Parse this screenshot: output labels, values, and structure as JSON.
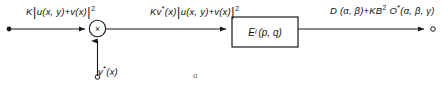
{
  "figure": {
    "caption": "a",
    "type": "signal-flow-block-diagram"
  },
  "labels": {
    "input_left": {
      "prefix": "K",
      "bar_open": "|",
      "body": "u(x, y)+v(x)",
      "bar_close": "|",
      "exponent": "2",
      "plain_text": "K|u(x, y)+v(x)|2"
    },
    "middle": {
      "prefix": "Kv",
      "star": "*",
      "arg": "(x)",
      "bar_open": "|",
      "body": "u(x, y)+v(x)",
      "bar_close": "|",
      "exponent": "2",
      "plain_text": "Kv*(x)|u(x, y)+v(x)|2"
    },
    "output_right": {
      "term1": "D (α, β)",
      "operator": "+",
      "term2_prefix": "KB",
      "term2_exponent": "2",
      "term3_symbol": "O",
      "term3_star": "*",
      "term3_args": "(α, β, γ)",
      "plain_text": "D (α, β)+KB2 O*(α, β, γ)"
    },
    "bottom_input": {
      "symbol": "v",
      "star": "*",
      "arg": "(x)",
      "plain_text": "v*(x)"
    }
  },
  "nodes": {
    "multiplier": {
      "glyph": "×",
      "shape": "circle"
    },
    "operator_block": {
      "symbol": "E",
      "subscript": "i",
      "args": "(p, q)",
      "plain_text": "Ei (p, q)"
    }
  },
  "terminals": {
    "input_left": "filled-dot",
    "bottom_input": "open-circle",
    "output_right": "open-circle"
  },
  "colors": {
    "stroke": "#1a1a1a",
    "text": "#111111",
    "background": "#ffffff",
    "caption": "#6f6f6f"
  }
}
